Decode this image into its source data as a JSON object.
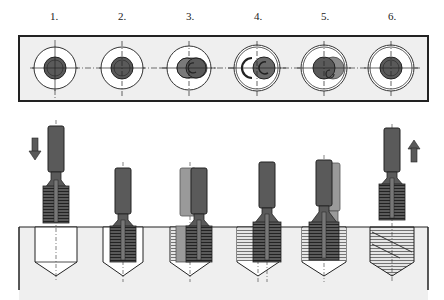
{
  "diagram": {
    "type": "technical-process-diagram",
    "steps": [
      {
        "label": "1.",
        "x": 54,
        "phase": "approach",
        "arrow": "down"
      },
      {
        "label": "2.",
        "x": 122,
        "phase": "plunge into bore"
      },
      {
        "label": "3.",
        "x": 190,
        "phase": "radial infeed"
      },
      {
        "label": "4.",
        "x": 258,
        "phase": "circular interpolation"
      },
      {
        "label": "5.",
        "x": 325,
        "phase": "return to center"
      },
      {
        "label": "6.",
        "x": 392,
        "phase": "retract",
        "arrow": "up"
      }
    ],
    "top_view": {
      "description": "plan view of bores with tool positions and center lines"
    },
    "side_view": {
      "description": "section through workpiece showing bore and thread mill"
    },
    "colors": {
      "tool_dark": "#5a5a5a",
      "tool_ghost": "#9a9a9a",
      "workpiece": "#efefef",
      "outline": "#222222",
      "thread_fill": "#bdbdbd"
    }
  }
}
